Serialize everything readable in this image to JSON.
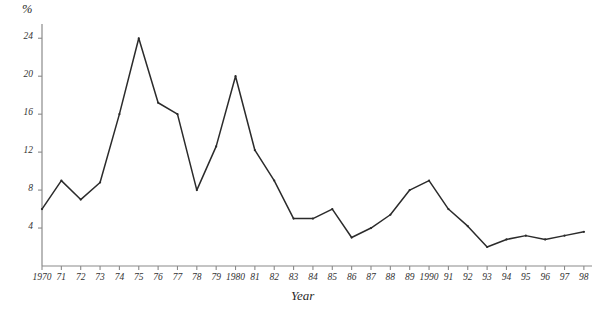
{
  "chart_data": {
    "type": "line",
    "title": "",
    "subtitle": "",
    "xlabel": "Year",
    "ylabel": "%",
    "x": [
      1970,
      1971,
      1972,
      1973,
      1974,
      1975,
      1976,
      1977,
      1978,
      1979,
      1980,
      1981,
      1982,
      1983,
      1984,
      1985,
      1986,
      1987,
      1988,
      1989,
      1990,
      1991,
      1992,
      1993,
      1994,
      1995,
      1996,
      1997,
      1998
    ],
    "xtick_labels": [
      "1970",
      "71",
      "72",
      "73",
      "74",
      "75",
      "76",
      "77",
      "78",
      "79",
      "1980",
      "81",
      "82",
      "83",
      "84",
      "85",
      "86",
      "87",
      "88",
      "89",
      "1990",
      "91",
      "92",
      "93",
      "94",
      "95",
      "96",
      "97",
      "98"
    ],
    "values": [
      6.0,
      9.0,
      7.0,
      8.8,
      16.0,
      24.0,
      17.2,
      16.0,
      8.0,
      12.6,
      20.0,
      12.2,
      9.0,
      5.0,
      5.0,
      6.0,
      3.0,
      4.0,
      5.4,
      8.0,
      9.0,
      6.0,
      4.2,
      2.0,
      2.8,
      3.2,
      2.8,
      3.2,
      3.6
    ],
    "ytick_values": [
      4,
      8,
      12,
      16,
      20,
      24
    ],
    "ytick_labels": [
      "4",
      "8",
      "12",
      "16",
      "20",
      "24"
    ],
    "ylim": [
      0,
      25.5
    ],
    "xlim": [
      1969.3,
      1998.6
    ],
    "grid": false,
    "legend": null,
    "legend_position": "none",
    "series": [
      {
        "name": "percent",
        "values": [
          6.0,
          9.0,
          7.0,
          8.8,
          16.0,
          24.0,
          17.2,
          16.0,
          8.0,
          12.6,
          20.0,
          12.2,
          9.0,
          5.0,
          5.0,
          6.0,
          3.0,
          4.0,
          5.4,
          8.0,
          9.0,
          6.0,
          4.2,
          2.0,
          2.8,
          3.2,
          2.8,
          3.2,
          3.6
        ],
        "color": "#2b2b2b"
      }
    ],
    "annotations": []
  },
  "style": {
    "line_color": "#2b2b2b",
    "axis_color": "#8a8a8a",
    "text_color": "#333333",
    "background": "#ffffff"
  }
}
